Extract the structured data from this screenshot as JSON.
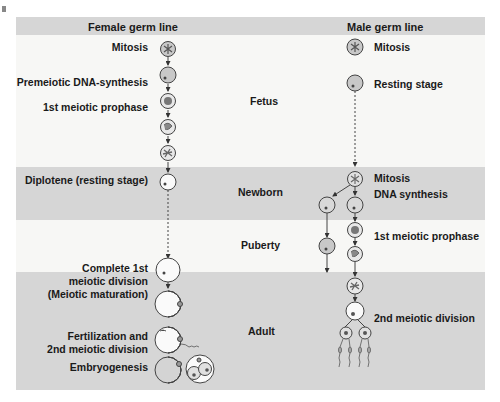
{
  "headers": {
    "female": "Female germ line",
    "male": "Male germ line"
  },
  "periods": [
    {
      "label": "Fetus",
      "shade": "white"
    },
    {
      "label": "Newborn",
      "shade": "gray"
    },
    {
      "label": "Puberty",
      "shade": "white"
    },
    {
      "label": "Adult",
      "shade": "gray"
    }
  ],
  "female_stages": [
    {
      "label": "Mitosis"
    },
    {
      "label": "Premeiotic DNA-synthesis"
    },
    {
      "label": "1st meiotic prophase"
    },
    {
      "label": "Diplotene (resting stage)"
    },
    {
      "label_lines": [
        "Complete 1st",
        "meiotic division",
        "(Meiotic maturation)"
      ]
    },
    {
      "label_lines": [
        "Fertilization and",
        "2nd meiotic division"
      ]
    },
    {
      "label": "Embryogenesis"
    }
  ],
  "male_stages": [
    {
      "label": "Mitosis"
    },
    {
      "label": "Resting stage"
    },
    {
      "label_lines": [
        "Mitosis",
        "DNA synthesis"
      ]
    },
    {
      "label": "1st meiotic prophase"
    },
    {
      "label": "2nd meiotic division"
    }
  ],
  "colors": {
    "band_gray": "#d6d6d6",
    "band_white": "#f7f7f5",
    "cell_fill": "#c8c8c8",
    "line": "#333333"
  }
}
